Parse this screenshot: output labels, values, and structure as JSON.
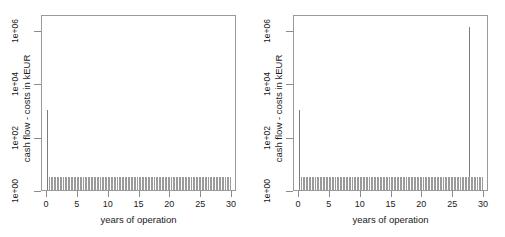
{
  "figure": {
    "panel_count": 2,
    "background": "#ffffff",
    "axis_color": "#9a9a9a",
    "bar_color": "#9b9b9b",
    "spike_color": "#7d7d7d"
  },
  "chart_data": [
    {
      "type": "bar",
      "panel": "left",
      "title": "",
      "xlabel": "years of operation",
      "ylabel": "cash flow - costs in kEUR",
      "yscale": "log",
      "xlim": [
        -0.8,
        30.8
      ],
      "ylim": [
        1,
        4000000
      ],
      "grid": false,
      "legend": null,
      "xticks": [
        0,
        5,
        10,
        15,
        20,
        25,
        30
      ],
      "xtick_labels": [
        "0",
        "5",
        "10",
        "15",
        "20",
        "25",
        "30"
      ],
      "yticks": [
        1,
        100,
        10000,
        1000000
      ],
      "ytick_labels": [
        "1e+00",
        "1e+02",
        "1e+04",
        "1e+06"
      ],
      "annotations": [
        "initial investment spike at year 0 reaching about 1e+03 kEUR",
        "dense field of small annual cash-flow bars near 1e+00 across all 30 years"
      ],
      "series": [
        {
          "name": "initial investment spike",
          "x": [
            0.08
          ],
          "values": [
            1000
          ]
        },
        {
          "name": "annual cash flow - costs",
          "x": [
            0.35,
            0.6,
            0.85,
            1.1,
            1.35,
            1.6,
            1.85,
            2.1,
            2.35,
            2.6,
            2.85,
            3.1,
            3.35,
            3.6,
            3.85,
            4.1,
            4.35,
            4.6,
            4.85,
            5.1,
            5.35,
            5.6,
            5.85,
            6.1,
            6.35,
            6.6,
            6.85,
            7.1,
            7.35,
            7.6,
            7.85,
            8.1,
            8.35,
            8.6,
            8.85,
            9.1,
            9.35,
            9.6,
            9.85,
            10.1,
            10.35,
            10.6,
            10.85,
            11.1,
            11.35,
            11.6,
            11.85,
            12.1,
            12.35,
            12.6,
            12.85,
            13.1,
            13.35,
            13.6,
            13.85,
            14.1,
            14.35,
            14.6,
            14.85,
            15.1,
            15.35,
            15.6,
            15.85,
            16.1,
            16.35,
            16.6,
            16.85,
            17.1,
            17.35,
            17.6,
            17.85,
            18.1,
            18.35,
            18.6,
            18.85,
            19.1,
            19.35,
            19.6,
            19.85,
            20.1,
            20.35,
            20.6,
            20.85,
            21.1,
            21.35,
            21.6,
            21.85,
            22.1,
            22.35,
            22.6,
            22.85,
            23.1,
            23.35,
            23.6,
            23.85,
            24.1,
            24.35,
            24.6,
            24.85,
            25.1,
            25.35,
            25.6,
            25.85,
            26.1,
            26.35,
            26.6,
            26.85,
            27.1,
            27.35,
            27.6,
            27.85,
            28.1,
            28.35,
            28.6,
            28.85,
            29.1,
            29.35,
            29.6
          ],
          "values": [
            3.0,
            3.0,
            3.0,
            3.0,
            3.0,
            3.0,
            3.0,
            3.0,
            3.0,
            3.0,
            3.0,
            3.0,
            3.0,
            3.0,
            3.0,
            3.0,
            3.0,
            3.0,
            3.0,
            3.0,
            3.0,
            3.0,
            3.0,
            3.0,
            3.0,
            3.0,
            3.0,
            3.0,
            3.0,
            3.0,
            3.0,
            3.0,
            3.0,
            3.0,
            3.0,
            3.0,
            3.0,
            3.0,
            3.0,
            3.0,
            3.0,
            3.0,
            3.0,
            3.0,
            3.0,
            3.0,
            3.0,
            3.0,
            3.0,
            3.0,
            3.0,
            3.0,
            3.0,
            3.0,
            3.0,
            3.0,
            3.0,
            3.0,
            3.0,
            3.0,
            3.0,
            3.0,
            3.0,
            3.0,
            3.0,
            3.0,
            3.0,
            3.0,
            3.0,
            3.0,
            3.0,
            3.0,
            3.0,
            3.0,
            3.0,
            3.0,
            3.0,
            3.0,
            3.0,
            3.0,
            3.0,
            3.0,
            3.0,
            3.0,
            3.0,
            3.0,
            3.0,
            3.0,
            3.0,
            3.0,
            3.0,
            3.0,
            3.0,
            3.0,
            3.0,
            3.0,
            3.0,
            3.0,
            3.0,
            3.0,
            3.0,
            3.0,
            3.0,
            3.0,
            3.0,
            3.0,
            3.0,
            3.0,
            3.0,
            3.0,
            3.0,
            3.0,
            3.0,
            3.0,
            3.0,
            3.0,
            3.0,
            3.0
          ]
        }
      ]
    },
    {
      "type": "bar",
      "panel": "right",
      "title": "",
      "xlabel": "years of operation",
      "ylabel": "cash flow - costs in kEUR",
      "yscale": "log",
      "xlim": [
        -0.8,
        30.8
      ],
      "ylim": [
        1,
        4000000
      ],
      "grid": false,
      "legend": null,
      "xticks": [
        0,
        5,
        10,
        15,
        20,
        25,
        30
      ],
      "xtick_labels": [
        "0",
        "5",
        "10",
        "15",
        "20",
        "25",
        "30"
      ],
      "yticks": [
        1,
        100,
        10000,
        1000000
      ],
      "ytick_labels": [
        "1e+00",
        "1e+02",
        "1e+04",
        "1e+06"
      ],
      "annotations": [
        "initial investment spike at year 0 reaching about 1e+03 kEUR",
        "large decommissioning spike at about year 27.5 reaching about 1e+06 kEUR",
        "dense field of small annual cash-flow bars near 1e+00 across all 30 years"
      ],
      "series": [
        {
          "name": "initial investment spike",
          "x": [
            0.08
          ],
          "values": [
            1000
          ]
        },
        {
          "name": "decommissioning spike",
          "x": [
            27.5
          ],
          "values": [
            1300000
          ]
        },
        {
          "name": "annual cash flow - costs",
          "x": [
            0.35,
            0.6,
            0.85,
            1.1,
            1.35,
            1.6,
            1.85,
            2.1,
            2.35,
            2.6,
            2.85,
            3.1,
            3.35,
            3.6,
            3.85,
            4.1,
            4.35,
            4.6,
            4.85,
            5.1,
            5.35,
            5.6,
            5.85,
            6.1,
            6.35,
            6.6,
            6.85,
            7.1,
            7.35,
            7.6,
            7.85,
            8.1,
            8.35,
            8.6,
            8.85,
            9.1,
            9.35,
            9.6,
            9.85,
            10.1,
            10.35,
            10.6,
            10.85,
            11.1,
            11.35,
            11.6,
            11.85,
            12.1,
            12.35,
            12.6,
            12.85,
            13.1,
            13.35,
            13.6,
            13.85,
            14.1,
            14.35,
            14.6,
            14.85,
            15.1,
            15.35,
            15.6,
            15.85,
            16.1,
            16.35,
            16.6,
            16.85,
            17.1,
            17.35,
            17.6,
            17.85,
            18.1,
            18.35,
            18.6,
            18.85,
            19.1,
            19.35,
            19.6,
            19.85,
            20.1,
            20.35,
            20.6,
            20.85,
            21.1,
            21.35,
            21.6,
            21.85,
            22.1,
            22.35,
            22.6,
            22.85,
            23.1,
            23.35,
            23.6,
            23.85,
            24.1,
            24.35,
            24.6,
            24.85,
            25.1,
            25.35,
            25.6,
            25.85,
            26.1,
            26.35,
            26.6,
            26.85,
            27.1,
            27.35,
            27.6,
            27.85,
            28.1,
            28.35,
            28.6,
            28.85,
            29.1,
            29.35,
            29.6
          ],
          "values": [
            3.0,
            3.0,
            3.0,
            3.0,
            3.0,
            3.0,
            3.0,
            3.0,
            3.0,
            3.0,
            3.0,
            3.0,
            3.0,
            3.0,
            3.0,
            3.0,
            3.0,
            3.0,
            3.0,
            3.0,
            3.0,
            3.0,
            3.0,
            3.0,
            3.0,
            3.0,
            3.0,
            3.0,
            3.0,
            3.0,
            3.0,
            3.0,
            3.0,
            3.0,
            3.0,
            3.0,
            3.0,
            3.0,
            3.0,
            3.0,
            3.0,
            3.0,
            3.0,
            3.0,
            3.0,
            3.0,
            3.0,
            3.0,
            3.0,
            3.0,
            3.0,
            3.0,
            3.0,
            3.0,
            3.0,
            3.0,
            3.0,
            3.0,
            3.0,
            3.0,
            3.0,
            3.0,
            3.0,
            3.0,
            3.0,
            3.0,
            3.0,
            3.0,
            3.0,
            3.0,
            3.0,
            3.0,
            3.0,
            3.0,
            3.0,
            3.0,
            3.0,
            3.0,
            3.0,
            3.0,
            3.0,
            3.0,
            3.0,
            3.0,
            3.0,
            3.0,
            3.0,
            3.0,
            3.0,
            3.0,
            3.0,
            3.0,
            3.0,
            3.0,
            3.0,
            3.0,
            3.0,
            3.0,
            3.0,
            3.0,
            3.0,
            3.0,
            3.0,
            3.0,
            3.0,
            3.0,
            3.0,
            3.0,
            3.0,
            3.0,
            3.0,
            3.0,
            3.0,
            3.0,
            3.0,
            3.0,
            3.0,
            3.0
          ]
        }
      ]
    }
  ]
}
